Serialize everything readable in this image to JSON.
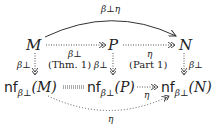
{
  "diagram": {
    "nodes": {
      "M": "M",
      "P": "P",
      "N": "N",
      "nfM": {
        "op": "nf",
        "sub": "β⊥",
        "arg": "(M)"
      },
      "nfP": {
        "op": "nf",
        "sub": "β⊥",
        "arg": "(P)"
      },
      "nfN": {
        "op": "nf",
        "sub": "β⊥",
        "arg": "(N)"
      }
    },
    "edges": {
      "M_to_N_top": "β⊥η",
      "M_to_P": "β⊥",
      "P_to_N": "η",
      "M_down": "β⊥",
      "P_down": "β⊥",
      "N_down": "β⊥",
      "nfP_to_nfN": "η",
      "nfM_to_nfN_bottom": "η"
    },
    "annotations": {
      "left_square": "(Thm. 1)",
      "right_square": "(Part 1)"
    },
    "colors": {
      "ink": "#222222",
      "dotted": "#555555"
    }
  }
}
